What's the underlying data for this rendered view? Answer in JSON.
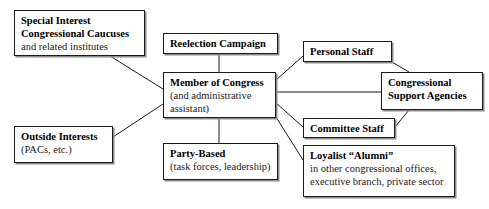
{
  "diagram": {
    "line_color": "#1a1a1a",
    "box_border_color": "#1a1a1a",
    "box_shadow_color": "#8c8c8c",
    "background_color": "#ffffff",
    "nodes": [
      {
        "id": "special-interest",
        "title": "Special Interest",
        "title2": "Congressional Caucuses",
        "sub": "and related institutes"
      },
      {
        "id": "reelection-campaign",
        "title": "Reelection Campaign"
      },
      {
        "id": "personal-staff",
        "title": "Personal Staff"
      },
      {
        "id": "member-of-congress",
        "title": "Member of Congress",
        "sub": "(and administrative",
        "sub2": "assistant)"
      },
      {
        "id": "congressional-support-agencies",
        "title": "Congressional",
        "title2": "Support Agencies"
      },
      {
        "id": "committee-staff",
        "title": "Committee Staff"
      },
      {
        "id": "outside-interests",
        "title": "Outside Interests",
        "sub": "(PACs, etc.)"
      },
      {
        "id": "party-based",
        "title": "Party-Based",
        "sub": "(task forces, leadership)"
      },
      {
        "id": "loyalist-alumni",
        "title": "Loyalist “Alumni”",
        "sub": "in other congressional offices,",
        "sub2": "executive branch, private sector"
      }
    ],
    "connectors": [
      {
        "from": "special-interest",
        "to": "member-of-congress"
      },
      {
        "from": "reelection-campaign",
        "to": "member-of-congress"
      },
      {
        "from": "outside-interests",
        "to": "member-of-congress"
      },
      {
        "from": "member-of-congress",
        "to": "party-based"
      },
      {
        "from": "member-of-congress",
        "to": "personal-staff"
      },
      {
        "from": "member-of-congress",
        "to": "committee-staff"
      },
      {
        "from": "member-of-congress",
        "to": "congressional-support-agencies"
      },
      {
        "from": "member-of-congress",
        "to": "loyalist-alumni"
      },
      {
        "from": "personal-staff",
        "to": "congressional-support-agencies"
      },
      {
        "from": "committee-staff",
        "to": "congressional-support-agencies"
      }
    ]
  }
}
